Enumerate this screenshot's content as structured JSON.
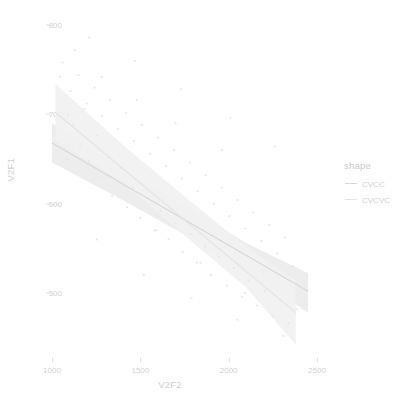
{
  "chart_data": {
    "type": "scatter",
    "title": "",
    "xlabel": "V2F2",
    "ylabel": "V2F1",
    "xlim": [
      820,
      2620
    ],
    "ylim": [
      455,
      812
    ],
    "xticks": [
      1000,
      1500,
      2000,
      2500
    ],
    "yticks": [
      500,
      600,
      700,
      800
    ],
    "xtick_labels": [
      "1000",
      "1500",
      "2000",
      "2500"
    ],
    "ytick_labels": [
      "500",
      "600",
      "700",
      "800"
    ],
    "grid": false,
    "legend": {
      "title": "shape",
      "position": "right",
      "entries": [
        {
          "label": "CVCC",
          "color": "#d8d8d8",
          "key": "line-key"
        },
        {
          "label": "CVCVC",
          "color": "#e4e4e4",
          "key": "line-key"
        }
      ]
    },
    "series": [
      {
        "name": "CVCC",
        "color": "#d8d8d8",
        "ribbon_color": "#ebebeb",
        "fit": {
          "x": [
            1000,
            2450
          ],
          "y": [
            668,
            502
          ]
        },
        "ribbon_upper": {
          "x": [
            1000,
            1400,
            1800,
            2100,
            2450
          ],
          "y": [
            690,
            640,
            592,
            556,
            522
          ]
        },
        "ribbon_lower": {
          "x": [
            1000,
            1400,
            1800,
            2100,
            2450
          ],
          "y": [
            646,
            604,
            560,
            522,
            478
          ]
        },
        "points": [
          [
            1045,
            742
          ],
          [
            1090,
            700
          ],
          [
            1120,
            688
          ],
          [
            1160,
            664
          ],
          [
            1185,
            706
          ],
          [
            1210,
            648
          ],
          [
            1255,
            676
          ],
          [
            1280,
            630
          ],
          [
            1320,
            652
          ],
          [
            1355,
            620
          ],
          [
            1390,
            640
          ],
          [
            1425,
            596
          ],
          [
            1460,
            618
          ],
          [
            1500,
            584
          ],
          [
            1540,
            606
          ],
          [
            1580,
            570
          ],
          [
            1615,
            592
          ],
          [
            1660,
            560
          ],
          [
            1700,
            578
          ],
          [
            1740,
            546
          ],
          [
            1785,
            566
          ],
          [
            1820,
            534
          ],
          [
            1865,
            552
          ],
          [
            1900,
            520
          ],
          [
            1945,
            540
          ],
          [
            1990,
            508
          ],
          [
            2030,
            528
          ],
          [
            2075,
            496
          ],
          [
            2115,
            514
          ],
          [
            2160,
            486
          ],
          [
            2205,
            502
          ],
          [
            2250,
            474
          ],
          [
            2295,
            492
          ],
          [
            2340,
            466
          ],
          [
            2385,
            482
          ],
          [
            1130,
            772
          ],
          [
            1280,
            742
          ],
          [
            1480,
            716
          ],
          [
            1700,
            690
          ],
          [
            1960,
            660
          ],
          [
            1255,
            560
          ],
          [
            1520,
            520
          ],
          [
            1790,
            494
          ],
          [
            2050,
            470
          ],
          [
            2310,
            452
          ]
        ]
      },
      {
        "name": "CVCVC",
        "color": "#e4e4e4",
        "ribbon_color": "#f1f1f1",
        "fit": {
          "x": [
            1020,
            2380
          ],
          "y": [
            702,
            478
          ]
        },
        "ribbon_upper": {
          "x": [
            1020,
            1400,
            1800,
            2100,
            2380
          ],
          "y": [
            734,
            666,
            600,
            552,
            514
          ]
        },
        "ribbon_lower": {
          "x": [
            1020,
            1400,
            1800,
            2100,
            2380
          ],
          "y": [
            670,
            624,
            556,
            506,
            442
          ]
        },
        "points": [
          [
            1060,
            758
          ],
          [
            1105,
            726
          ],
          [
            1150,
            744
          ],
          [
            1195,
            712
          ],
          [
            1240,
            730
          ],
          [
            1285,
            698
          ],
          [
            1330,
            716
          ],
          [
            1375,
            684
          ],
          [
            1420,
            702
          ],
          [
            1465,
            670
          ],
          [
            1510,
            688
          ],
          [
            1555,
            656
          ],
          [
            1600,
            674
          ],
          [
            1645,
            642
          ],
          [
            1690,
            660
          ],
          [
            1735,
            628
          ],
          [
            1780,
            646
          ],
          [
            1825,
            614
          ],
          [
            1870,
            632
          ],
          [
            1915,
            600
          ],
          [
            1960,
            618
          ],
          [
            2005,
            586
          ],
          [
            2050,
            604
          ],
          [
            2095,
            572
          ],
          [
            2140,
            590
          ],
          [
            2185,
            558
          ],
          [
            2230,
            576
          ],
          [
            2275,
            544
          ],
          [
            2320,
            562
          ],
          [
            2365,
            530
          ],
          [
            1090,
            650
          ],
          [
            1340,
            608
          ],
          [
            1590,
            570
          ],
          [
            1840,
            534
          ],
          [
            2090,
            500
          ],
          [
            1210,
            786
          ],
          [
            1470,
            760
          ],
          [
            1730,
            728
          ],
          [
            2010,
            696
          ],
          [
            2260,
            664
          ]
        ]
      }
    ]
  }
}
